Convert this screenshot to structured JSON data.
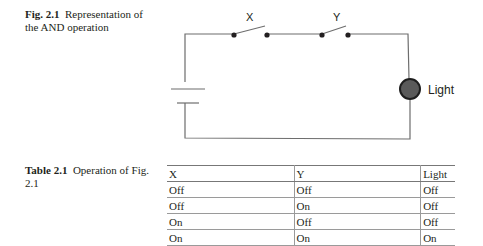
{
  "figure": {
    "label": "Fig. 2.1",
    "caption": "Representation of the AND operation",
    "circuit": {
      "switch_labels": [
        "X",
        "Y"
      ],
      "output_label": "Light",
      "lamp_color": "#5a5a5a",
      "wire_color": "#6d6d6d"
    }
  },
  "table": {
    "label": "Table 2.1",
    "caption": "Operation of Fig. 2.1",
    "headers": [
      "X",
      "Y",
      "Light"
    ],
    "rows": [
      [
        "Off",
        "Off",
        "Off"
      ],
      [
        "Off",
        "On",
        "Off"
      ],
      [
        "On",
        "Off",
        "Off"
      ],
      [
        "On",
        "On",
        "On"
      ]
    ]
  }
}
